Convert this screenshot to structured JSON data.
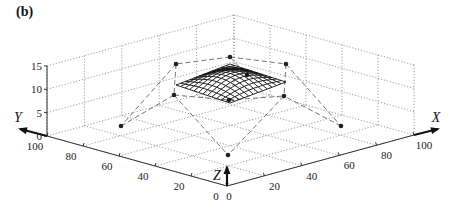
{
  "panel_label": "(b)",
  "axes": {
    "x": {
      "label": "X",
      "ticks": [
        "0",
        "20",
        "40",
        "60",
        "80",
        "100"
      ]
    },
    "y": {
      "label": "Y",
      "ticks": [
        "0",
        "20",
        "40",
        "60",
        "80",
        "100"
      ]
    },
    "z": {
      "label": "Z",
      "ticks": [
        "0",
        "5",
        "10",
        "15"
      ]
    }
  },
  "colors": {
    "grid": "#888888",
    "axis": "#333333",
    "net": "#666666",
    "surface": "#111111",
    "point": "#222222"
  },
  "control_points_px": [
    [
      230,
      57
    ],
    [
      176,
      64
    ],
    [
      286,
      64
    ],
    [
      174,
      95
    ],
    [
      229,
      100
    ],
    [
      284,
      96
    ],
    [
      121,
      126
    ],
    [
      341,
      126
    ],
    [
      228,
      155
    ],
    [
      247,
      75
    ]
  ]
}
